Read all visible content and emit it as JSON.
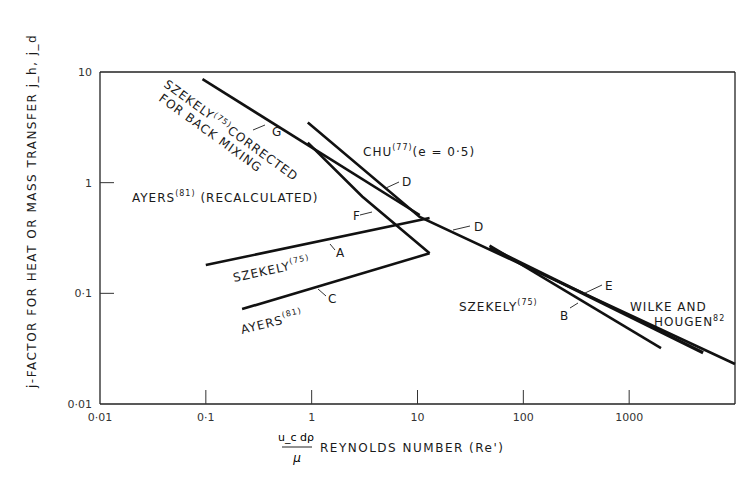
{
  "chart_data": {
    "type": "line",
    "title": "",
    "xlabel": "REYNOLDS NUMBER (Re')",
    "xlabel_fraction": {
      "numerator": "u_c dρ",
      "denominator": "μ"
    },
    "ylabel": "j-FACTOR FOR HEAT OR MASS TRANSFER  j_h, j_d",
    "xscale": "log",
    "yscale": "log",
    "xlim": [
      0.01,
      10000
    ],
    "ylim": [
      0.01,
      10
    ],
    "xticks": [
      "0·01",
      "0·1",
      "1",
      "10",
      "100",
      "1000"
    ],
    "xtick_values": [
      0.01,
      0.1,
      1,
      10,
      100,
      1000
    ],
    "yticks": [
      "0·01",
      "0·1",
      "1",
      "10"
    ],
    "ytick_values": [
      0.01,
      0.1,
      1,
      10
    ],
    "grid": false,
    "series": [
      {
        "name": "G",
        "label": "SZEKELY(75) CORRECTED FOR BACK MIXING",
        "x": [
          0.093,
          10.5
        ],
        "y": [
          8.6,
          0.51
        ]
      },
      {
        "name": "D",
        "label": "CHU(77) (e = 0·5)",
        "x": [
          0.92,
          10.5,
          10000
        ],
        "y": [
          3.5,
          0.49,
          0.023
        ]
      },
      {
        "name": "F",
        "label": "AYERS(81) (RECALCULATED)",
        "x": [
          0.92,
          3.0,
          13
        ],
        "y": [
          2.3,
          0.75,
          0.23
        ]
      },
      {
        "name": "A",
        "label": "SZEKELY(75)",
        "x": [
          0.1,
          13
        ],
        "y": [
          0.18,
          0.48
        ]
      },
      {
        "name": "C",
        "label": "AYERS(81)",
        "x": [
          0.22,
          13
        ],
        "y": [
          0.072,
          0.23
        ]
      },
      {
        "name": "B",
        "label": "SZEKELY(75)",
        "x": [
          48,
          2000
        ],
        "y": [
          0.27,
          0.032
        ]
      },
      {
        "name": "E",
        "label": "WILKE AND HOUGEN(82)",
        "x": [
          48,
          5000
        ],
        "y": [
          0.26,
          0.029
        ]
      }
    ],
    "annotations": [
      {
        "text": "SZEKELY",
        "sup": "(75)",
        "rest": "CORRECTED"
      },
      {
        "text": "FOR BACK MIXING"
      },
      {
        "text": "CHU",
        "sup": "(77)",
        "rest": "(e = 0·5)"
      },
      {
        "text": "AYERS",
        "sup": "(81)",
        "rest": " (RECALCULATED)"
      },
      {
        "text": "SZEKELY",
        "sup": "(75)",
        "rest": ""
      },
      {
        "text": "AYERS",
        "sup": "(81)",
        "rest": ""
      },
      {
        "text": "SZEKELY",
        "sup": "(75)",
        "rest": ""
      },
      {
        "text": "WILKE AND"
      },
      {
        "text": "HOUGEN",
        "sup": "82",
        "rest": ""
      }
    ],
    "line_letters": [
      "G",
      "D",
      "F",
      "D",
      "A",
      "C",
      "B",
      "E"
    ]
  }
}
